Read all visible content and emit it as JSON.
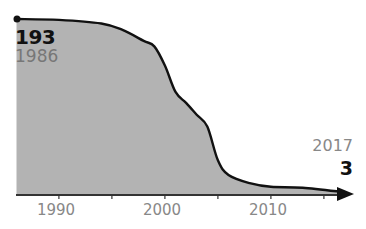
{
  "chart_data": {
    "type": "area",
    "xlabel": "",
    "ylabel": "",
    "x": [
      1986,
      1990,
      1994,
      1996,
      1998,
      1999,
      2000,
      2001,
      2002,
      2003,
      2004,
      2005,
      2006,
      2008,
      2010,
      2013,
      2017
    ],
    "values": [
      193,
      192,
      188,
      181,
      169,
      163,
      142,
      113,
      101,
      88,
      75,
      38,
      22,
      13,
      9,
      8,
      3
    ],
    "xlim": [
      1986,
      2017
    ],
    "ylim": [
      0,
      193
    ],
    "x_ticks": [
      1990,
      1995,
      2000,
      2005,
      2010,
      2015
    ],
    "x_tick_labels": [
      "1990",
      "2000",
      "2010"
    ],
    "grid": false,
    "legend": null,
    "annotations": [
      {
        "label": "193",
        "sublabel": "1986",
        "position": "start"
      },
      {
        "label": "3",
        "sublabel": "2017",
        "position": "end"
      }
    ],
    "colors": {
      "fill": "#b3b3b3",
      "line": "#111111",
      "axis": "#333333",
      "tick_label": "#888888"
    }
  },
  "labels": {
    "start_value": "193",
    "start_year": "1986",
    "end_year": "2017",
    "end_value": "3",
    "tick_1990": "1990",
    "tick_2000": "2000",
    "tick_2010": "2010"
  }
}
